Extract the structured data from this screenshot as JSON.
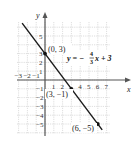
{
  "chart_data": {
    "type": "line",
    "title": "",
    "xlabel": "x",
    "ylabel": "y",
    "xlim": [
      -3,
      7
    ],
    "ylim": [
      -5,
      5
    ],
    "grid": true,
    "x_ticks": [
      "-3",
      "-2",
      "-1",
      "1",
      "2",
      "4",
      "5",
      "6",
      "7"
    ],
    "y_ticks": [
      "5",
      "3",
      "2",
      "1",
      "-1",
      "-2",
      "-3",
      "-4",
      "-5"
    ],
    "series": [
      {
        "name": "y = -4/3 x + 3",
        "equation": "y = −4/3 x + 3",
        "slope": -1.3333,
        "intercept": 3,
        "points": [
          {
            "x": 0,
            "y": 3,
            "label": "(0, 3)"
          },
          {
            "x": 3,
            "y": -1,
            "label": "(3, −1)"
          },
          {
            "x": 6,
            "y": -5,
            "label": "(6, −5)"
          }
        ]
      }
    ],
    "annotations": {
      "equation_prefix": "y = −",
      "frac_num": "4",
      "frac_den": "3",
      "equation_suffix": "x + 3"
    }
  },
  "labels": {
    "p1": "(0, 3)",
    "p2": "(3, −1)",
    "p3": "(6, −5)",
    "x_axis": "x",
    "y_axis": "y"
  }
}
